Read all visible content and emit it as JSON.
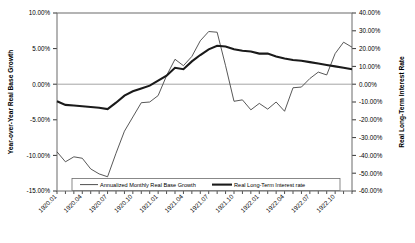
{
  "chart_data": {
    "type": "line",
    "title": "",
    "xlabel": "",
    "ylabel": "Year-over-Year Real Base Growth",
    "y2label": "Real Long-Term Interest Rate",
    "ylim": [
      -15,
      10
    ],
    "y2lim": [
      -60,
      40
    ],
    "grid": false,
    "legend_position": "bottom",
    "y_ticks": [
      "10.00%",
      "5.00%",
      "0.00%",
      "-5.00%",
      "-10.00%",
      "-15.00%"
    ],
    "y_tick_values": [
      10,
      5,
      0,
      -5,
      -10,
      -15
    ],
    "y2_ticks": [
      "40.00%",
      "30.00%",
      "20.00%",
      "10.00%",
      "0.00%",
      "-10.00%",
      "-20.00%",
      "-30.00%",
      "-40.00%",
      "-50.00%",
      "-60.00%"
    ],
    "y2_tick_values": [
      40,
      30,
      20,
      10,
      0,
      -10,
      -20,
      -30,
      -40,
      -50,
      -60
    ],
    "x_tick_labels": [
      "1920.01",
      "1920.04",
      "1920.07",
      "1920.10",
      "1921.01",
      "1921.04",
      "1921.07",
      "1921.10",
      "1922.01",
      "1922.04",
      "1922.07",
      "1922.10"
    ],
    "x": [
      "1920.01",
      "1920.02",
      "1920.03",
      "1920.04",
      "1920.05",
      "1920.06",
      "1920.07",
      "1920.08",
      "1920.09",
      "1920.10",
      "1920.11",
      "1920.12",
      "1921.01",
      "1921.02",
      "1921.03",
      "1921.04",
      "1921.05",
      "1921.06",
      "1921.07",
      "1921.08",
      "1921.09",
      "1921.10",
      "1921.11",
      "1921.12",
      "1922.01",
      "1922.02",
      "1922.03",
      "1922.04",
      "1922.05",
      "1922.06",
      "1922.07",
      "1922.08",
      "1922.09",
      "1922.10",
      "1922.11",
      "1922.12"
    ],
    "series": [
      {
        "name": "Annualized Monthly Real Base Growth",
        "axis": "left",
        "line_width": "thin",
        "color": "#3a3a3a",
        "values": [
          -9.5,
          -10.9,
          -10.2,
          -10.4,
          -11.9,
          -12.6,
          -13.0,
          -9.7,
          -6.6,
          -4.6,
          -2.6,
          -2.5,
          -1.6,
          1.2,
          3.5,
          2.6,
          3.9,
          6.1,
          7.4,
          7.3,
          2.6,
          -2.4,
          -2.2,
          -3.6,
          -2.7,
          -3.5,
          -2.5,
          -3.8,
          -0.5,
          -0.4,
          0.8,
          1.7,
          1.3,
          4.3,
          5.9,
          5.2
        ]
      },
      {
        "name": "Real Long-Term Interest rate",
        "axis": "right",
        "line_width": "thick",
        "color": "#1a1a1a",
        "values_left_scale": [
          -2.4,
          -2.9,
          -3.0,
          -3.1,
          -3.2,
          -3.3,
          -3.5,
          -2.6,
          -1.6,
          -1.0,
          -0.6,
          -0.2,
          0.5,
          1.2,
          2.3,
          2.1,
          3.2,
          4.1,
          4.9,
          5.4,
          5.3,
          4.9,
          4.7,
          4.6,
          4.3,
          4.3,
          3.9,
          3.6,
          3.4,
          3.3,
          3.1,
          2.9,
          2.7,
          2.5,
          2.3,
          2.1
        ],
        "values": [
          -9.6,
          -11.6,
          -12.0,
          -12.4,
          -12.8,
          -13.2,
          -14.0,
          -10.4,
          -6.4,
          -4.0,
          -2.4,
          -0.8,
          2.0,
          4.8,
          9.2,
          8.4,
          12.8,
          16.4,
          19.6,
          21.6,
          21.2,
          19.6,
          18.8,
          18.4,
          17.2,
          17.2,
          15.6,
          14.4,
          13.6,
          13.2,
          12.4,
          11.6,
          10.8,
          10.0,
          9.2,
          8.4
        ]
      }
    ]
  },
  "legend": {
    "items": [
      {
        "label": "Annualized Monthly Real Base Growth"
      },
      {
        "label": "Real Long-Term Interest rate"
      }
    ]
  }
}
